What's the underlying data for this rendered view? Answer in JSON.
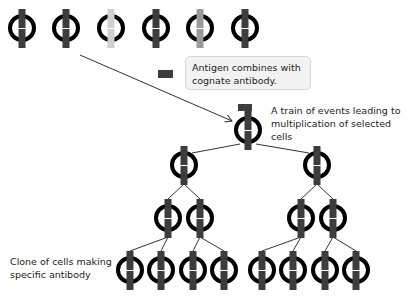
{
  "colors": {
    "ring": "#000000",
    "receptor_dark": "#3d3d3d",
    "receptor_light": "#cfcfcf",
    "receptor_mid": "#9a9a9a",
    "line": "#333333",
    "callout_bg": "#f2f2f2",
    "callout_border": "#d6d6d6"
  },
  "callout": {
    "line1": "Antigen combines with",
    "line2": "cognate antibody."
  },
  "labels": {
    "train_line1": "A train of events leading to",
    "train_line2": "multiplication of selected cells",
    "clone_line1": "Clone of cells making",
    "clone_line2": "specific antibody"
  },
  "top_row_cells": [
    {
      "x": 22,
      "shade": "dark"
    },
    {
      "x": 66,
      "shade": "dark"
    },
    {
      "x": 111,
      "shade": "light"
    },
    {
      "x": 156,
      "shade": "dark"
    },
    {
      "x": 200,
      "shade": "mid"
    },
    {
      "x": 245,
      "shade": "dark"
    }
  ],
  "antigen": {
    "x": 158,
    "y": 70,
    "w": 15,
    "h": 8
  },
  "selected_cell": {
    "x": 248,
    "y": 130
  },
  "tree": {
    "level1": [
      {
        "x": 184,
        "y": 165
      },
      {
        "x": 317,
        "y": 165
      }
    ],
    "level2": [
      {
        "x": 168,
        "y": 218
      },
      {
        "x": 200,
        "y": 218
      },
      {
        "x": 301,
        "y": 218
      },
      {
        "x": 333,
        "y": 218
      }
    ],
    "level3": [
      {
        "x": 130,
        "y": 270
      },
      {
        "x": 161,
        "y": 270
      },
      {
        "x": 193,
        "y": 270
      },
      {
        "x": 224,
        "y": 270
      },
      {
        "x": 262,
        "y": 270
      },
      {
        "x": 293,
        "y": 270
      },
      {
        "x": 325,
        "y": 270
      },
      {
        "x": 356,
        "y": 270
      }
    ]
  }
}
